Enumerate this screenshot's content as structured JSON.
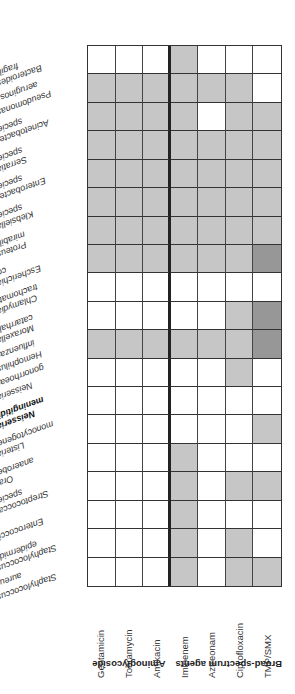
{
  "table": {
    "orientation": "rotated 180 degrees",
    "colors": {
      "none": "#ffffff",
      "coverage": "#c6c6c6",
      "strong_coverage": "#979797",
      "grid_line": "#333333"
    },
    "groups": [
      {
        "label": "Aminoglycoside",
        "columns": [
          "Gentamicin",
          "Tobramycin",
          "Amikacin"
        ]
      },
      {
        "label": "Broad-spectrum agents",
        "columns": [
          "Imipenem",
          "Aztreonam",
          "Ciprofloxacin",
          "TMP/SMX"
        ]
      }
    ],
    "columns": [
      "Gentamicin",
      "Tobramycin",
      "Amikacin",
      "Imipenem",
      "Aztreonam",
      "Ciprofloxacin",
      "TMP/SMX"
    ],
    "legend_codes": {
      "W": "no coverage (white)",
      "G": "coverage (light gray)",
      "D": "coverage (dark gray)"
    },
    "rows": [
      {
        "label": "Bacteroides fragilis",
        "line1": "Bacteroides",
        "line2": "fragilis",
        "sup": "",
        "bold": false,
        "cells": [
          "W",
          "W",
          "W",
          "G",
          "W",
          "W",
          "W"
        ]
      },
      {
        "label": "Pseudomonas aeruginosa",
        "line1": "Pseudomonas",
        "line2": "aeruginosa",
        "sup": "a",
        "bold": false,
        "cells": [
          "G",
          "G",
          "G",
          "G",
          "G",
          "G",
          "W"
        ]
      },
      {
        "label": "Acinetobacter species",
        "line1": "Acinetobacter",
        "line2": "species",
        "sup": "",
        "bold": false,
        "cells": [
          "G",
          "G",
          "G",
          "G",
          "W",
          "G",
          "G"
        ]
      },
      {
        "label": "Serratia species",
        "line1": "Serratia",
        "line2": "species",
        "sup": "",
        "bold": false,
        "cells": [
          "G",
          "G",
          "G",
          "G",
          "G",
          "G",
          "G"
        ]
      },
      {
        "label": "Enterobacter species",
        "line1": "Enterobacter",
        "line2": "species",
        "sup": "",
        "bold": false,
        "cells": [
          "G",
          "G",
          "G",
          "G",
          "G",
          "G",
          "G"
        ]
      },
      {
        "label": "Klebsiella species",
        "line1": "Klebsiella",
        "line2": "species",
        "sup": "",
        "bold": false,
        "cells": [
          "G",
          "G",
          "G",
          "G",
          "G",
          "G",
          "G"
        ]
      },
      {
        "label": "Proteus mirabilis",
        "line1": "Proteus",
        "line2": "mirabilis",
        "sup": "",
        "bold": false,
        "cells": [
          "G",
          "G",
          "G",
          "G",
          "G",
          "G",
          "G"
        ]
      },
      {
        "label": "Escherichia coli",
        "line1": "Escherichia",
        "line2": "coli",
        "sup": "",
        "bold": false,
        "cells": [
          "G",
          "G",
          "G",
          "G",
          "G",
          "G",
          "D"
        ]
      },
      {
        "label": "Chlamydia trachomatis",
        "line1": "Chlamydia",
        "line2": "trachomatis",
        "sup": "",
        "bold": false,
        "cells": [
          "W",
          "W",
          "W",
          "W",
          "W",
          "W",
          "W"
        ]
      },
      {
        "label": "Moraxella catarrhalis",
        "line1": "Moraxella",
        "line2": "catarrhalis",
        "sup": "",
        "bold": false,
        "cells": [
          "W",
          "W",
          "W",
          "W",
          "W",
          "G",
          "D"
        ]
      },
      {
        "label": "Hemophilus influenzae",
        "line1": "Hemophilus",
        "line2": "influenzae",
        "sup": "a",
        "bold": false,
        "cells": [
          "G",
          "G",
          "G",
          "G",
          "G",
          "G",
          "D"
        ]
      },
      {
        "label": "Neisseria gonorrhoeae",
        "line1": "Neisseria",
        "line2": "gonorrhoeae",
        "sup": "a",
        "bold": false,
        "cells": [
          "W",
          "W",
          "W",
          "W",
          "W",
          "G",
          "W"
        ]
      },
      {
        "label": "Neisseria meningitidis",
        "line1": "Neisseria",
        "line2": "meningitidis",
        "sup": "",
        "bold": true,
        "cells": [
          "W",
          "W",
          "W",
          "W",
          "W",
          "W",
          "W"
        ]
      },
      {
        "label": "Listeria monocytogenes",
        "line1": "Listeria",
        "line2": "monocytogenes",
        "sup": "",
        "bold": false,
        "cells": [
          "W",
          "W",
          "W",
          "W",
          "W",
          "W",
          "G"
        ]
      },
      {
        "label": "Oral anaerobes",
        "line1": "Oral",
        "line2": "anaerobes",
        "sup": "",
        "bold": false,
        "cells": [
          "W",
          "W",
          "W",
          "G",
          "W",
          "W",
          "W"
        ]
      },
      {
        "label": "Streptococcal species",
        "line1": "Streptococcal",
        "line2": "species",
        "sup": "",
        "bold": false,
        "cells": [
          "W",
          "W",
          "W",
          "G",
          "W",
          "G",
          "G"
        ]
      },
      {
        "label": "Enterococci",
        "line1": "Enterococci",
        "line2": "",
        "sup": "a",
        "bold": false,
        "cells": [
          "W",
          "W",
          "W",
          "G",
          "W",
          "W",
          "W"
        ]
      },
      {
        "label": "Staphylococcus epidermidis",
        "line1": "Staphylococcus",
        "line2": "epidermidis",
        "sup": "",
        "bold": false,
        "cells": [
          "W",
          "W",
          "W",
          "G",
          "W",
          "G",
          "W"
        ]
      },
      {
        "label": "Staphylococcus aureus",
        "line1": "Staphylococcus",
        "line2": "aureus",
        "sup": "a",
        "bold": false,
        "cells": [
          "W",
          "W",
          "W",
          "G",
          "W",
          "G",
          "G"
        ]
      }
    ]
  }
}
